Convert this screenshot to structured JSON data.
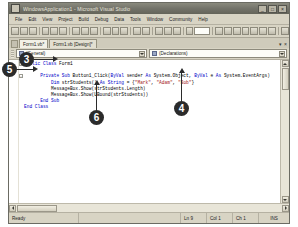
{
  "window": {
    "title": "WindowsApplication1 - Microsoft Visual Studio",
    "app_icon": "visual-studio-icon",
    "buttons": {
      "minimize": "_",
      "maximize": "□",
      "close": "×"
    }
  },
  "menubar": {
    "items": [
      {
        "label": "File"
      },
      {
        "label": "Edit"
      },
      {
        "label": "View"
      },
      {
        "label": "Project"
      },
      {
        "label": "Build"
      },
      {
        "label": "Debug"
      },
      {
        "label": "Data"
      },
      {
        "label": "Tools"
      },
      {
        "label": "Window"
      },
      {
        "label": "Community"
      },
      {
        "label": "Help"
      }
    ]
  },
  "tabs": {
    "items": [
      {
        "label": "Form1.vb*",
        "active": true
      },
      {
        "label": "Form1.vb [Design]*",
        "active": false
      }
    ],
    "close_label": "×",
    "dropdown_label": "▾"
  },
  "dropdowns": {
    "left": {
      "value": "(General)",
      "icon": "class-icon"
    },
    "right": {
      "value": "(Declarations)",
      "icon": "declarations-icon"
    }
  },
  "editor": {
    "lines": [
      {
        "indent": 0,
        "fold": "-",
        "segments": [
          {
            "t": "Public Class",
            "c": "kw"
          },
          {
            "t": " Form1",
            "c": "plain"
          }
        ]
      },
      {
        "indent": 0,
        "fold": "",
        "segments": []
      },
      {
        "indent": 2,
        "fold": "-",
        "segments": [
          {
            "t": "Private Sub",
            "c": "kw"
          },
          {
            "t": " Button1_Click(",
            "c": "plain"
          },
          {
            "t": "ByVal",
            "c": "kw"
          },
          {
            "t": " sender ",
            "c": "plain"
          },
          {
            "t": "As",
            "c": "kw"
          },
          {
            "t": " System.Object, ",
            "c": "plain"
          },
          {
            "t": "ByVal",
            "c": "kw"
          },
          {
            "t": " e ",
            "c": "plain"
          },
          {
            "t": "As",
            "c": "kw"
          },
          {
            "t": " System.EventArgs)",
            "c": "plain"
          }
        ]
      },
      {
        "indent": 3,
        "fold": "",
        "segments": [
          {
            "t": "Dim",
            "c": "kw"
          },
          {
            "t": " strStudents() ",
            "c": "plain"
          },
          {
            "t": "As String",
            "c": "kw"
          },
          {
            "t": " = {",
            "c": "plain"
          },
          {
            "t": "\"Mark\"",
            "c": "str"
          },
          {
            "t": ", ",
            "c": "plain"
          },
          {
            "t": "\"Adam\"",
            "c": "str"
          },
          {
            "t": ", ",
            "c": "plain"
          },
          {
            "t": "\"Bob\"",
            "c": "str"
          },
          {
            "t": "}",
            "c": "plain"
          }
        ]
      },
      {
        "indent": 3,
        "fold": "",
        "segments": [
          {
            "t": "MessageBox.Show(strStudents.Length)",
            "c": "plain"
          }
        ]
      },
      {
        "indent": 3,
        "fold": "",
        "segments": [
          {
            "t": "MessageBox.Show(UBound(strStudents))",
            "c": "plain"
          }
        ]
      },
      {
        "indent": 2,
        "fold": "",
        "segments": [
          {
            "t": "End Sub",
            "c": "kw"
          }
        ]
      },
      {
        "indent": 0,
        "fold": "",
        "segments": [
          {
            "t": "End Class",
            "c": "kw"
          }
        ]
      }
    ]
  },
  "statusbar": {
    "ready": "Ready",
    "line": "Ln 9",
    "col": "Col 1",
    "ch": "Ch 1",
    "insert_mode": "INS"
  },
  "callouts": [
    {
      "number": "5",
      "target": "general-dropdown"
    },
    {
      "number": "3",
      "target": "class-declaration-line"
    },
    {
      "number": "4",
      "target": "string-array-initializer"
    },
    {
      "number": "6",
      "target": "ubound-messagebox-line"
    }
  ],
  "colors": {
    "titlebar": "#73736a",
    "chrome": "#d8d4c4",
    "editor_bg": "#ffffff",
    "keyword": "#0000c8",
    "string": "#a31515",
    "comment": "#008000",
    "callout": "#2b2b2b"
  }
}
